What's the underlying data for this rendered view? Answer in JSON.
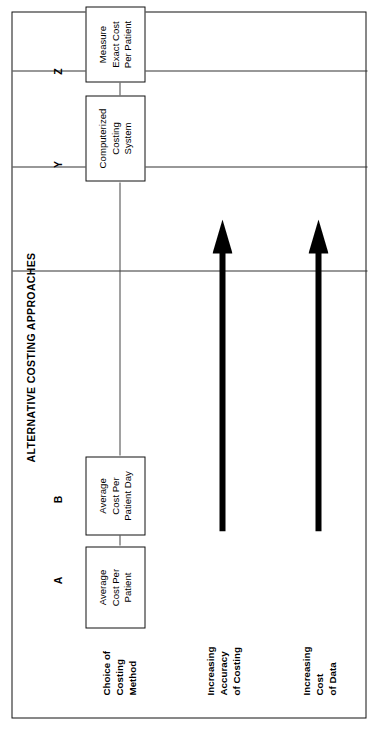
{
  "figure": {
    "title": "ALTERNATIVE COSTING APPROACHES",
    "orientation": "rotated-90-ccw",
    "frame_color": "#111111",
    "ink_color": "#000000",
    "background_color": "#ffffff"
  },
  "stage_letters": [
    {
      "id": "A",
      "label": "A"
    },
    {
      "id": "B",
      "label": "B"
    },
    {
      "id": "Y",
      "label": "Y"
    },
    {
      "id": "Z",
      "label": "Z"
    }
  ],
  "boxes": [
    {
      "id": "A",
      "lines": [
        "Average",
        "Cost Per",
        "Patient"
      ],
      "text": "Average Cost Per Patient"
    },
    {
      "id": "B",
      "lines": [
        "Average",
        "Cost Per",
        "Patient Day"
      ],
      "text": "Average Cost Per Patient Day"
    },
    {
      "id": "Y",
      "lines": [
        "Computerized",
        "Costing",
        "System"
      ],
      "text": "Computerized Costing System"
    },
    {
      "id": "Z",
      "lines": [
        "Measure",
        "Exact Cost",
        "Per Patient"
      ],
      "text": "Measure Exact Cost Per Patient"
    }
  ],
  "rows": [
    {
      "id": "choice-of-costing-method",
      "lines": [
        "Choice of",
        "Costing",
        "Method"
      ],
      "text": "Choice of Costing Method"
    },
    {
      "id": "increasing-accuracy-of-costing",
      "lines": [
        "Increasing",
        "Accuracy",
        "of Costing"
      ],
      "text": "Increasing Accuracy of Costing"
    },
    {
      "id": "increasing-cost-of-data",
      "lines": [
        "Increasing",
        "Cost",
        "of Data"
      ],
      "text": "Increasing Cost of Data"
    }
  ],
  "arrows": [
    {
      "id": "accuracy-arrow",
      "direction": "increasing",
      "points_toward": "Z"
    },
    {
      "id": "cost-arrow",
      "direction": "increasing",
      "points_toward": "Z"
    }
  ]
}
